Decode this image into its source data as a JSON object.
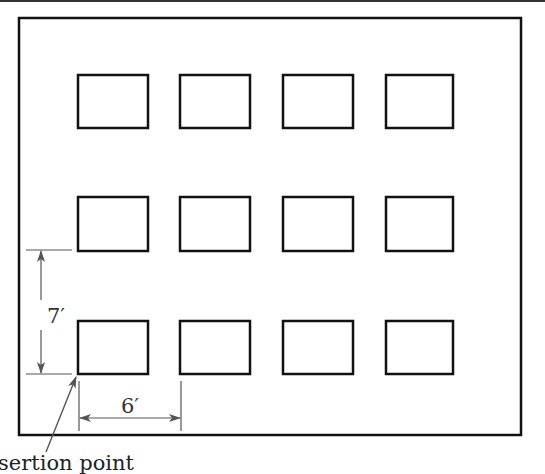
{
  "diagram": {
    "outer_box": {
      "x": 18,
      "y": 18,
      "w": 503,
      "h": 417
    },
    "grid": {
      "rows": 3,
      "columns": 4,
      "row_y": [
        74,
        197,
        321
      ],
      "col_x": [
        77,
        179,
        283,
        385
      ],
      "rect_w": 70,
      "rect_h": 54
    },
    "dimensions": {
      "vertical": {
        "label": "7′",
        "value": "7 feet",
        "meaning": "row spacing"
      },
      "horizontal": {
        "label": "6′",
        "value": "6 feet",
        "meaning": "column spacing"
      }
    },
    "annotation": {
      "label": "sertion point",
      "full_label_hint": "Insertion point (cropped at left edge)"
    },
    "colors": {
      "stroke": "#111111",
      "dimension": "#555555",
      "background": "#ffffff"
    }
  }
}
